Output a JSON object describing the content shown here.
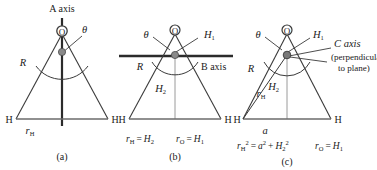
{
  "figure": {
    "type": "scientific-diagram",
    "colors": {
      "line": "#3a3a3a",
      "axis_thick": "#2b2b2b",
      "center_dot": "#808080",
      "text": "#1a1a1a",
      "background": "#ffffff"
    }
  },
  "panels": [
    {
      "id": "a",
      "caption": "(a)",
      "axis_label": "A axis",
      "atom_top": "O",
      "atom_left": "H",
      "atom_right": "H",
      "angle_label": "θ",
      "side_label": "R",
      "base_label_main": "r",
      "base_label_sub": "H",
      "equations": []
    },
    {
      "id": "b",
      "caption": "(b)",
      "axis_label": "B axis",
      "atom_top": "O",
      "atom_left": "H",
      "atom_right": "H",
      "angle_label": "θ",
      "side_label": "R",
      "h1_main": "H",
      "h1_sub": "1",
      "h2_main": "H",
      "h2_sub": "2",
      "equations": [
        {
          "lhs_main": "r",
          "lhs_sub": "H",
          "rel": "=",
          "rhs_main": "H",
          "rhs_sub": "2"
        },
        {
          "lhs_main": "r",
          "lhs_sub": "O",
          "rel": "=",
          "rhs_main": "H",
          "rhs_sub": "1"
        }
      ]
    },
    {
      "id": "c",
      "caption": "(c)",
      "axis_label": "C axis",
      "axis_note_line1": "(perpendicular",
      "axis_note_line2": "to plane)",
      "atom_top": "O",
      "atom_left": "H",
      "atom_right": "H",
      "angle_label": "θ",
      "side_label": "R",
      "h1_main": "H",
      "h1_sub": "1",
      "h2_main": "H",
      "h2_sub": "2",
      "rh_main": "r",
      "rh_sub": "H",
      "a_label": "a",
      "equations": [
        {
          "text": "r_H^2 = a^2 + H_2^2"
        },
        {
          "text": "r_O = H_1"
        }
      ]
    }
  ]
}
